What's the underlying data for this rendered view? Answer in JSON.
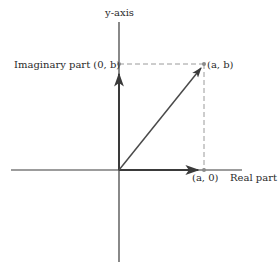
{
  "diagram": {
    "type": "complex-plane",
    "labels": {
      "y_axis": "y-axis",
      "real_axis": "Real part",
      "imaginary_point": "Imaginary part (0, b)",
      "point_ab": "(a, b)",
      "point_a0": "(a, 0)"
    },
    "geometry": {
      "origin": [
        119,
        170
      ],
      "point_ab": [
        204,
        64
      ],
      "point_0b": [
        119,
        64
      ],
      "point_a0": [
        204,
        170
      ],
      "x_axis_range": [
        11,
        242
      ],
      "y_axis_range": [
        22,
        262
      ]
    },
    "colors": {
      "axis": "#3a3a3a",
      "vector": "#4a4a4a",
      "dashed": "#9a9a9a",
      "point": "#8a8a8a",
      "text": "#2a2a2a"
    }
  }
}
